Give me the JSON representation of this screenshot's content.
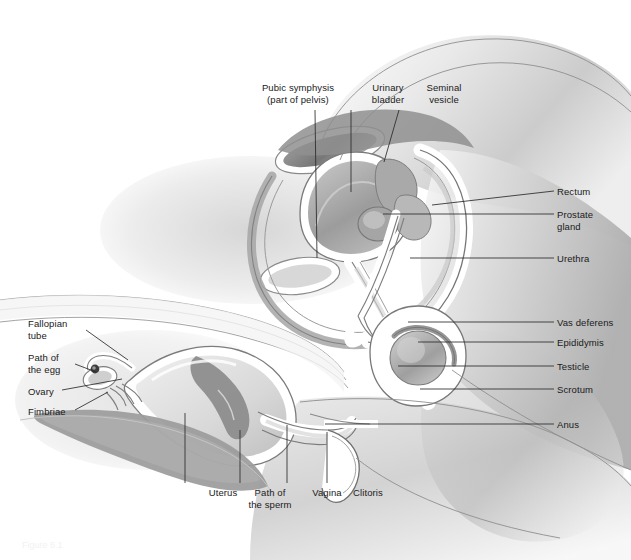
{
  "figure": {
    "caption": "Figure 6.1",
    "width": 631,
    "height": 560,
    "colors": {
      "ink": "#1a1a1a",
      "leader": "#2b2b2b",
      "body_light": "#f0f0f0",
      "body_mid": "#d2d2d2",
      "body_dark": "#9a9a9a",
      "organ_dark": "#8d8d8d",
      "organ_mid": "#b5b5b5",
      "organ_light": "#e4e4e4",
      "outline": "#6f6f6f",
      "background": "#ffffff"
    }
  },
  "labels": {
    "top": [
      {
        "id": "pubic-symphysis",
        "line1": "Pubic symphysis",
        "line2": "(part of pelvis)",
        "x": 243,
        "y": 82,
        "align": "center",
        "leader": {
          "x1": 315,
          "y1": 110,
          "x2": 317,
          "y2": 258
        }
      },
      {
        "id": "urinary-bladder",
        "line1": "Urinary",
        "line2": "bladder",
        "x": 333,
        "y": 82,
        "align": "center",
        "leader": {
          "x1": 351,
          "y1": 110,
          "x2": 351,
          "y2": 192
        }
      },
      {
        "id": "seminal-vesicle",
        "line1": "Seminal",
        "line2": "vesicle",
        "x": 389,
        "y": 82,
        "align": "center",
        "leader": {
          "x1": 399,
          "y1": 110,
          "x2": 384,
          "y2": 162
        }
      }
    ],
    "right": [
      {
        "id": "rectum",
        "line1": "Rectum",
        "line2": "",
        "x": 557,
        "y": 186,
        "leader": {
          "x1": 554,
          "y1": 191,
          "x2": 432,
          "y2": 205
        }
      },
      {
        "id": "prostate-gland",
        "line1": "Prostate",
        "line2": "gland",
        "x": 557,
        "y": 209,
        "leader": {
          "x1": 554,
          "y1": 214,
          "x2": 383,
          "y2": 214
        }
      },
      {
        "id": "urethra",
        "line1": "Urethra",
        "line2": "",
        "x": 557,
        "y": 253,
        "leader": {
          "x1": 554,
          "y1": 258,
          "x2": 410,
          "y2": 258
        }
      },
      {
        "id": "vas-deferens",
        "line1": "Vas deferens",
        "line2": "",
        "x": 557,
        "y": 317,
        "leader": {
          "x1": 554,
          "y1": 322,
          "x2": 408,
          "y2": 322
        }
      },
      {
        "id": "epididymis",
        "line1": "Epididymis",
        "line2": "",
        "x": 557,
        "y": 337,
        "leader": {
          "x1": 554,
          "y1": 342,
          "x2": 418,
          "y2": 342
        }
      },
      {
        "id": "testicle",
        "line1": "Testicle",
        "line2": "",
        "x": 557,
        "y": 361,
        "leader": {
          "x1": 554,
          "y1": 366,
          "x2": 398,
          "y2": 366
        }
      },
      {
        "id": "scrotum",
        "line1": "Scrotum",
        "line2": "",
        "x": 557,
        "y": 384,
        "leader": {
          "x1": 554,
          "y1": 389,
          "x2": 420,
          "y2": 389
        }
      },
      {
        "id": "anus",
        "line1": "Anus",
        "line2": "",
        "x": 557,
        "y": 419,
        "leader": {
          "x1": 554,
          "y1": 424,
          "x2": 325,
          "y2": 424
        }
      }
    ],
    "left": [
      {
        "id": "fallopian-tube",
        "line1": "Fallopian",
        "line2": "tube",
        "x": 28,
        "y": 318,
        "leader": {
          "x1": 86,
          "y1": 330,
          "x2": 128,
          "y2": 360
        }
      },
      {
        "id": "path-of-the-egg",
        "line1": "Path of",
        "line2": "the egg",
        "x": 28,
        "y": 352,
        "leader": {
          "x1": 75,
          "y1": 364,
          "x2": 96,
          "y2": 372
        }
      },
      {
        "id": "ovary",
        "line1": "Ovary",
        "line2": "",
        "x": 28,
        "y": 386,
        "leader": {
          "x1": 62,
          "y1": 390,
          "x2": 122,
          "y2": 379
        }
      },
      {
        "id": "fimbriae",
        "line1": "Fimbriae",
        "line2": "",
        "x": 28,
        "y": 406,
        "leader": {
          "x1": 75,
          "y1": 410,
          "x2": 108,
          "y2": 392
        }
      }
    ],
    "bottom": [
      {
        "id": "uterus",
        "line1": "Uterus",
        "line2": "",
        "x": 168,
        "y": 487,
        "align": "center",
        "leader": {
          "x1": 185,
          "y1": 483,
          "x2": 185,
          "y2": 413
        }
      },
      {
        "id": "path-of-the-sperm",
        "line1": "Path of",
        "line2": "the sperm",
        "x": 215,
        "y": 487,
        "align": "center",
        "leader": {
          "x1": 240,
          "y1": 483,
          "x2": 240,
          "y2": 430
        }
      },
      {
        "id": "vagina",
        "line1": "Vagina",
        "line2": "",
        "x": 272,
        "y": 487,
        "align": "center",
        "leader": {
          "x1": 287,
          "y1": 483,
          "x2": 287,
          "y2": 425
        }
      },
      {
        "id": "clitoris",
        "line1": "Clitoris",
        "line2": "",
        "x": 313,
        "y": 487,
        "align": "center",
        "leader": {
          "x1": 327,
          "y1": 483,
          "x2": 327,
          "y2": 432
        }
      }
    ]
  }
}
